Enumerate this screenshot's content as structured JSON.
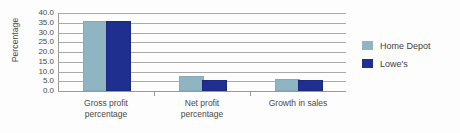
{
  "chart_data": {
    "type": "bar",
    "title": "",
    "xlabel": "",
    "ylabel": "Percentage",
    "ylim": [
      0,
      40
    ],
    "ytick_labels": [
      "40.0",
      "35.0",
      "30.0",
      "25.0",
      "20.0",
      "15.0",
      "10.0",
      "5.0",
      "0.0"
    ],
    "ytick_values": [
      40,
      35,
      30,
      25,
      20,
      15,
      10,
      5,
      0
    ],
    "grid": true,
    "legend_position": "right",
    "categories": [
      "Gross profit\npercentage",
      "Net profit\npercentage",
      "Growth in sales"
    ],
    "series": [
      {
        "name": "Home Depot",
        "color": "#8fb4c2",
        "values": [
          35.0,
          6.5,
          5.0
        ]
      },
      {
        "name": "Lowe's",
        "color": "#1f2f8f",
        "values": [
          35.0,
          4.7,
          4.5
        ]
      }
    ]
  },
  "legend": {
    "items": [
      {
        "label": "Home Depot",
        "color": "#8fb4c2"
      },
      {
        "label": "Lowe's",
        "color": "#1f2f8f"
      }
    ]
  }
}
